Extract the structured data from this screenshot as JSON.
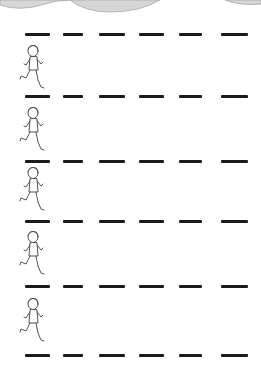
{
  "worksheet": {
    "type": "pre-writing tracing lines",
    "line_color": "#1a1a1a",
    "cloud_color": "#bdbdbd",
    "lines_y": [
      33,
      95,
      160,
      220,
      285,
      354
    ],
    "dash_segments": [
      [
        25,
        50
      ],
      [
        63,
        83
      ],
      [
        99,
        125
      ],
      [
        139,
        164
      ],
      [
        179,
        202
      ],
      [
        221,
        248
      ]
    ],
    "runners": [
      {
        "icon": "running-boy-icon",
        "top": 44
      },
      {
        "icon": "running-boy-icon",
        "top": 106
      },
      {
        "icon": "running-boy-icon",
        "top": 166
      },
      {
        "icon": "running-boy-icon",
        "top": 230
      },
      {
        "icon": "running-boy-icon",
        "top": 297
      }
    ]
  }
}
